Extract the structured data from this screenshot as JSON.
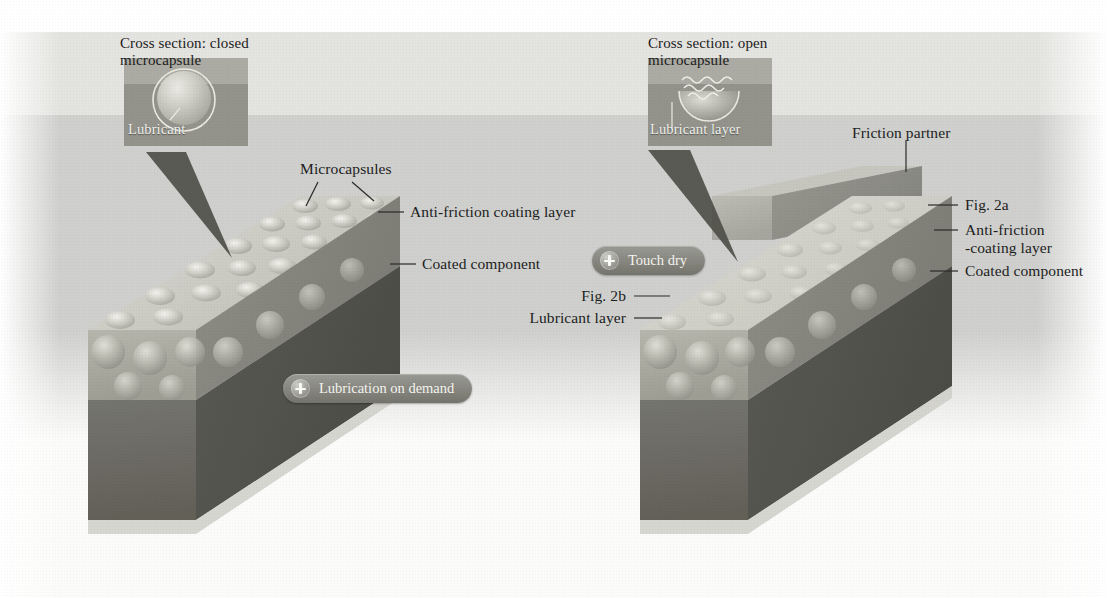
{
  "figure": {
    "panels": [
      {
        "id": "left",
        "state_label": "Lubrication on demand",
        "callout": {
          "title_line1": "Cross section: closed",
          "title_line2": "microcapsule",
          "inner_label": "Lubricant",
          "capsule_state": "closed"
        },
        "labels": [
          {
            "name": "microcapsules",
            "text": "Microcapsules"
          },
          {
            "name": "anti-friction-coating-layer",
            "text": "Anti-friction coating layer"
          },
          {
            "name": "coated-component",
            "text": "Coated component"
          }
        ]
      },
      {
        "id": "right",
        "state_label": "Touch dry",
        "callout": {
          "title_line1": "Cross section: open",
          "title_line2": "microcapsule",
          "inner_label": "Lubricant layer",
          "capsule_state": "open"
        },
        "labels": [
          {
            "name": "friction-partner",
            "text": "Friction partner"
          },
          {
            "name": "fig-2a",
            "text": "Fig. 2a"
          },
          {
            "name": "anti-friction-coating-layer-1",
            "text": "Anti-friction"
          },
          {
            "name": "anti-friction-coating-layer-2",
            "text": "-coating layer"
          },
          {
            "name": "coated-component",
            "text": "Coated component"
          },
          {
            "name": "fig-2b",
            "text": "Fig. 2b"
          },
          {
            "name": "lubricant-layer",
            "text": "Lubricant layer"
          }
        ]
      }
    ]
  },
  "colors": {
    "background_light": "#e3e3e0",
    "background_mid": "#cfd0cd",
    "top_face": "#cdcdc6",
    "coating_layer": "#a9a9a1",
    "substrate": "#6f6f68",
    "substrate_side": "#575751",
    "callout_box": "#9a9a93",
    "pill": "#86867f",
    "text": "#1d1d1d",
    "text_light": "#f2f2ee"
  }
}
